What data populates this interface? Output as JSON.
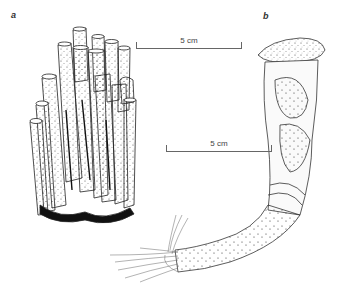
{
  "figure": {
    "panels": [
      {
        "label": "a",
        "subject": "cluster of tubular specimens",
        "scale_bar": {
          "label": "5 cm"
        }
      },
      {
        "label": "b",
        "subject": "single elongated specimen with fibrous base",
        "scale_bar": {
          "label": "5 cm"
        }
      }
    ]
  },
  "colors": {
    "ink": "#222222",
    "paper": "#ffffff",
    "scale": "#666666"
  }
}
